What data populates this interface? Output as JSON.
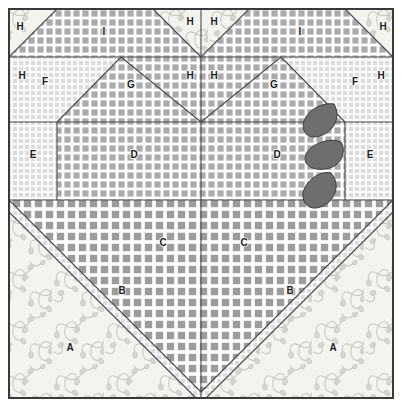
{
  "diagram": {
    "canvas": {
      "width": 402,
      "height": 407
    },
    "block": {
      "x": 8,
      "y": 8,
      "width": 386,
      "height": 391
    },
    "border_color": "#3a3a3a",
    "line_color": "#4a4a4a",
    "background": "#ffffff"
  },
  "fabrics": [
    {
      "key": "floral",
      "name": "cream floral print",
      "base": "#f2f2ee",
      "motif": "#c9c9c4"
    },
    {
      "key": "fine_grid",
      "name": "fine light grid check",
      "base": "#ffffff",
      "motif": "#d8d8d8"
    },
    {
      "key": "medium_grid",
      "name": "medium gray grid check",
      "base": "#ffffff",
      "motif": "#a8a8a8"
    },
    {
      "key": "coarse_grid",
      "name": "coarse dark grid check",
      "base": "#ffffff",
      "motif": "#9a9a9a"
    }
  ],
  "appliques": {
    "fill": "#6e6e6e",
    "stroke": "#3a3a3a",
    "count": 3,
    "shape": "leaf",
    "items": [
      {
        "name": "leaf-upper",
        "cx": 319,
        "cy": 120
      },
      {
        "name": "leaf-middle",
        "cx": 324,
        "cy": 155
      },
      {
        "name": "leaf-lower",
        "cx": 318,
        "cy": 190
      }
    ]
  },
  "labels": [
    {
      "id": "A-left",
      "text": "A",
      "x": 70,
      "y": 348,
      "piece": "A"
    },
    {
      "id": "A-right",
      "text": "A",
      "x": 333,
      "y": 348,
      "piece": "A"
    },
    {
      "id": "B-left",
      "text": "B",
      "x": 122,
      "y": 291,
      "piece": "B"
    },
    {
      "id": "B-right",
      "text": "B",
      "x": 290,
      "y": 291,
      "piece": "B"
    },
    {
      "id": "C-left",
      "text": "C",
      "x": 163,
      "y": 243,
      "piece": "C"
    },
    {
      "id": "C-right",
      "text": "C",
      "x": 244,
      "y": 243,
      "piece": "C"
    },
    {
      "id": "D-left",
      "text": "D",
      "x": 134,
      "y": 155,
      "piece": "D"
    },
    {
      "id": "D-right",
      "text": "D",
      "x": 277,
      "y": 155,
      "piece": "D"
    },
    {
      "id": "E-left",
      "text": "E",
      "x": 33,
      "y": 155,
      "piece": "E"
    },
    {
      "id": "E-right",
      "text": "E",
      "x": 370,
      "y": 155,
      "piece": "E"
    },
    {
      "id": "F-left",
      "text": "F",
      "x": 45,
      "y": 82,
      "piece": "F"
    },
    {
      "id": "F-right",
      "text": "F",
      "x": 355,
      "y": 82,
      "piece": "F"
    },
    {
      "id": "G-left",
      "text": "G",
      "x": 131,
      "y": 85,
      "piece": "G"
    },
    {
      "id": "G-right",
      "text": "G",
      "x": 274,
      "y": 85,
      "piece": "G"
    },
    {
      "id": "H-corner-tl",
      "text": "H",
      "x": 20,
      "y": 27,
      "piece": "H"
    },
    {
      "id": "H-corner-tr",
      "text": "H",
      "x": 383,
      "y": 27,
      "piece": "H"
    },
    {
      "id": "H-top-left",
      "text": "H",
      "x": 190,
      "y": 22,
      "piece": "H"
    },
    {
      "id": "H-top-right",
      "text": "H",
      "x": 214,
      "y": 22,
      "piece": "H"
    },
    {
      "id": "H-mid-left",
      "text": "H",
      "x": 190,
      "y": 76,
      "piece": "H"
    },
    {
      "id": "H-mid-right",
      "text": "H",
      "x": 214,
      "y": 76,
      "piece": "H"
    },
    {
      "id": "H-side-left",
      "text": "H",
      "x": 22,
      "y": 76,
      "piece": "H"
    },
    {
      "id": "H-side-right",
      "text": "H",
      "x": 381,
      "y": 76,
      "piece": "H"
    },
    {
      "id": "I-left",
      "text": "I",
      "x": 104,
      "y": 32,
      "piece": "I"
    },
    {
      "id": "I-right",
      "text": "I",
      "x": 300,
      "y": 32,
      "piece": "I"
    }
  ]
}
